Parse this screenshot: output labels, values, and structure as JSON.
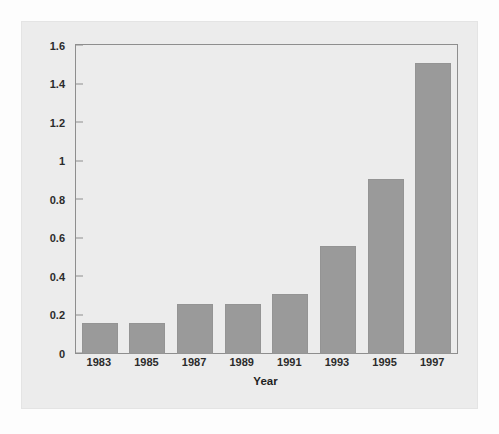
{
  "chart_data": {
    "type": "bar",
    "title": "",
    "xlabel": "Year",
    "ylabel": "Millions of Children",
    "categories": [
      "1983",
      "1985",
      "1987",
      "1989",
      "1991",
      "1993",
      "1995",
      "1997"
    ],
    "values": [
      0.15,
      0.15,
      0.25,
      0.25,
      0.3,
      0.55,
      0.9,
      1.5
    ],
    "ylim": [
      0,
      1.6
    ],
    "ytick_values": [
      0,
      0.2,
      0.4,
      0.6,
      0.8,
      1,
      1.2,
      1.4,
      1.6
    ],
    "ytick_labels": [
      "0",
      "0.2",
      "0.4",
      "0.6",
      "0.8",
      "1",
      "1.2",
      "1.4",
      "1.6"
    ],
    "grid": false,
    "legend": false,
    "series": [
      {
        "name": "Millions of Children",
        "values": [
          0.15,
          0.15,
          0.25,
          0.25,
          0.3,
          0.55,
          0.9,
          1.5
        ]
      }
    ],
    "colors": {
      "bar_fill": "#9a9a9a",
      "bar_edge": "#949494",
      "axis_line": "#8e8e8e",
      "panel_background": "#ececec",
      "page_background": "#fdfdfd",
      "text": "#1f1f1f"
    }
  }
}
